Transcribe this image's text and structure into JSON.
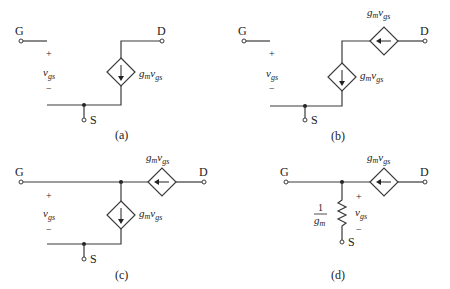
{
  "figure": {
    "panels": [
      {
        "id": "a",
        "caption": "(a)",
        "gate_label": "G",
        "drain_label": "D",
        "source_label": "S",
        "vgs_plus": "+",
        "vgs_var": "v",
        "vgs_sub": "gs",
        "vgs_minus": "−",
        "sources": [
          {
            "orientation": "vertical",
            "direction": "down",
            "label_g": "g",
            "label_m": "m",
            "label_v": "v",
            "label_gs": "gs"
          }
        ]
      },
      {
        "id": "b",
        "caption": "(b)",
        "gate_label": "G",
        "drain_label": "D",
        "source_label": "S",
        "vgs_plus": "+",
        "vgs_var": "v",
        "vgs_sub": "gs",
        "vgs_minus": "−",
        "sources": [
          {
            "orientation": "vertical",
            "direction": "down",
            "label_g": "g",
            "label_m": "m",
            "label_v": "v",
            "label_gs": "gs"
          },
          {
            "orientation": "horizontal",
            "direction": "left",
            "label_g": "g",
            "label_m": "m",
            "label_v": "v",
            "label_gs": "gs"
          }
        ]
      },
      {
        "id": "c",
        "caption": "(c)",
        "gate_label": "G",
        "drain_label": "D",
        "source_label": "S",
        "vgs_plus": "+",
        "vgs_var": "v",
        "vgs_sub": "gs",
        "vgs_minus": "−",
        "sources": [
          {
            "orientation": "vertical",
            "direction": "down",
            "label_g": "g",
            "label_m": "m",
            "label_v": "v",
            "label_gs": "gs"
          },
          {
            "orientation": "horizontal",
            "direction": "left",
            "label_g": "g",
            "label_m": "m",
            "label_v": "v",
            "label_gs": "gs"
          }
        ]
      },
      {
        "id": "d",
        "caption": "(d)",
        "gate_label": "G",
        "drain_label": "D",
        "source_label": "S",
        "vgs_plus": "+",
        "vgs_var": "v",
        "vgs_sub": "gs",
        "vgs_minus": "−",
        "resistor": {
          "num": "1",
          "den_g": "g",
          "den_m": "m"
        },
        "sources": [
          {
            "orientation": "horizontal",
            "direction": "left",
            "label_g": "g",
            "label_m": "m",
            "label_v": "v",
            "label_gs": "gs"
          }
        ]
      }
    ]
  }
}
